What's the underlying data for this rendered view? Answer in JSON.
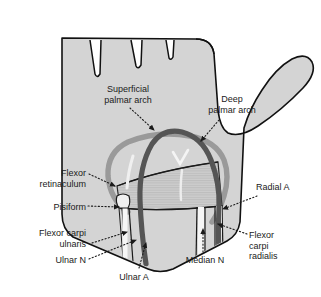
{
  "figure": {
    "type": "anatomical-diagram",
    "width": 321,
    "height": 297,
    "background": "#ffffff"
  },
  "colors": {
    "background": "#ffffff",
    "palm_fill": "#d4d4d4",
    "palm_outline": "#111111",
    "superficial_arch": "#555555",
    "deep_arch": "#9a9a9a",
    "retinaculum_fill": "#c9c9c9",
    "retinaculum_stripe": "#b4b4b4",
    "tendon_fill": "#f2f2f2",
    "tendon_outline": "#1a1a1a",
    "label_text": "#1a1a1a",
    "leader_line": "#1a1a1a"
  },
  "labels": [
    {
      "id": "superficial-palmar-arch",
      "text": "Superficial\npalmar arch",
      "align": "center",
      "x": 88,
      "y": 84,
      "width": 80,
      "leader": {
        "from_x": 130,
        "from_y": 108,
        "to_x": 155,
        "to_y": 131
      }
    },
    {
      "id": "deep-palmar-arch",
      "text": "Deep\npalmar arch",
      "align": "center",
      "x": 196,
      "y": 94,
      "width": 72,
      "leader": {
        "from_x": 220,
        "from_y": 120,
        "to_x": 200,
        "to_y": 142
      }
    },
    {
      "id": "flexor-retinaculum",
      "text": "Flexor\nretinaculum",
      "align": "right",
      "x": 14,
      "y": 168,
      "width": 72,
      "leader": {
        "from_x": 90,
        "from_y": 174,
        "to_x": 116,
        "to_y": 187
      }
    },
    {
      "id": "pisiform",
      "text": "Pisiform",
      "align": "right",
      "x": 24,
      "y": 202,
      "width": 62,
      "leader": {
        "from_x": 90,
        "from_y": 206,
        "to_x": 120,
        "to_y": 207
      }
    },
    {
      "id": "flexor-carpi-ulnaris",
      "text": "Flexor carpi\nulnaris",
      "align": "right",
      "x": 10,
      "y": 228,
      "width": 76,
      "leader": {
        "from_x": 92,
        "from_y": 243,
        "to_x": 128,
        "to_y": 232
      }
    },
    {
      "id": "ulnar-n",
      "text": "Ulnar N",
      "align": "right",
      "x": 22,
      "y": 256,
      "width": 64,
      "leader": {
        "from_x": 90,
        "from_y": 259,
        "to_x": 137,
        "to_y": 240
      }
    },
    {
      "id": "ulnar-a",
      "text": "Ulnar A",
      "align": "center",
      "x": 108,
      "y": 272,
      "width": 52,
      "leader": {
        "from_x": 140,
        "from_y": 269,
        "to_x": 147,
        "to_y": 242
      }
    },
    {
      "id": "median-n",
      "text": "Median N",
      "align": "center",
      "x": 176,
      "y": 256,
      "width": 58,
      "leader": {
        "from_x": 203,
        "from_y": 252,
        "to_x": 203,
        "to_y": 230
      }
    },
    {
      "id": "radial-a",
      "text": "Radial A",
      "align": "left",
      "x": 256,
      "y": 182,
      "width": 60,
      "leader": {
        "from_x": 256,
        "from_y": 196,
        "to_x": 222,
        "to_y": 209
      }
    },
    {
      "id": "flexor-carpi-radialis",
      "text": "Flexor\ncarpi\nradialis",
      "align": "left",
      "x": 248,
      "y": 230,
      "width": 60,
      "leader": {
        "from_x": 246,
        "from_y": 234,
        "to_x": 217,
        "to_y": 224
      }
    }
  ],
  "structures": [
    {
      "id": "hand-outline",
      "name": "palm and thumb silhouette"
    },
    {
      "id": "superficial-palmar-arch-vessel",
      "name": "superficial palmar arch artery"
    },
    {
      "id": "deep-palmar-arch-vessel",
      "name": "deep palmar arch artery"
    },
    {
      "id": "flexor-retinaculum-band",
      "name": "flexor retinaculum"
    },
    {
      "id": "pisiform-bone",
      "name": "pisiform bone"
    },
    {
      "id": "flexor-carpi-ulnaris-tendon",
      "name": "flexor carpi ulnaris tendon"
    },
    {
      "id": "flexor-carpi-radialis-tendon",
      "name": "flexor carpi radialis tendon"
    },
    {
      "id": "ulnar-nerve",
      "name": "ulnar nerve"
    },
    {
      "id": "ulnar-artery",
      "name": "ulnar artery"
    },
    {
      "id": "median-nerve",
      "name": "median nerve"
    },
    {
      "id": "radial-artery",
      "name": "radial artery"
    }
  ]
}
